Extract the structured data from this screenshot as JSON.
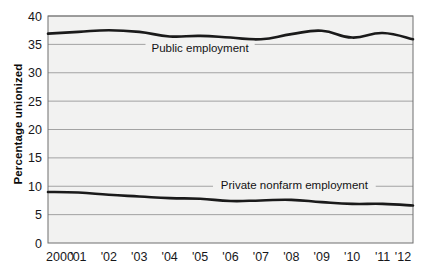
{
  "chart_data": {
    "type": "line",
    "title": "",
    "xlabel": "",
    "ylabel": "Percentage unionized",
    "x": [
      2000,
      2001,
      2002,
      2003,
      2004,
      2005,
      2006,
      2007,
      2008,
      2009,
      2010,
      2011,
      2012
    ],
    "categories": [
      "2000",
      "'01",
      "'02",
      "'03",
      "'04",
      "'05",
      "'06",
      "'07",
      "'08",
      "'09",
      "'10",
      "'11",
      "'12"
    ],
    "ylim": [
      0,
      40
    ],
    "yticks": [
      0,
      5,
      10,
      15,
      20,
      25,
      30,
      35,
      40
    ],
    "ytick_labels": [
      "0",
      "5",
      "10",
      "15",
      "20",
      "25",
      "30",
      "35",
      "40"
    ],
    "grid": true,
    "grid_axis": "y",
    "legend_position": "inline-annotation",
    "series": [
      {
        "name": "Public employment",
        "label": "Public employment",
        "values": [
          36.9,
          37.2,
          37.5,
          37.2,
          36.4,
          36.5,
          36.2,
          35.9,
          36.8,
          37.4,
          36.2,
          37.0,
          35.9
        ],
        "color": "#1a1a1a",
        "label_x": 2005,
        "label_y": 33.7
      },
      {
        "name": "Private nonfarm employment",
        "label": "Private nonfarm employment",
        "values": [
          9.0,
          8.9,
          8.5,
          8.2,
          7.9,
          7.8,
          7.4,
          7.5,
          7.6,
          7.2,
          6.9,
          6.9,
          6.6
        ],
        "color": "#1a1a1a",
        "label_x": 2008.1,
        "label_y": 9.6
      }
    ]
  },
  "style": {
    "plot_background": "#f2f2f1",
    "grid_color": "#9a9a9a",
    "border_color": "#6e6e6e",
    "line_color": "#1a1a1a",
    "text_color": "#17171a"
  }
}
